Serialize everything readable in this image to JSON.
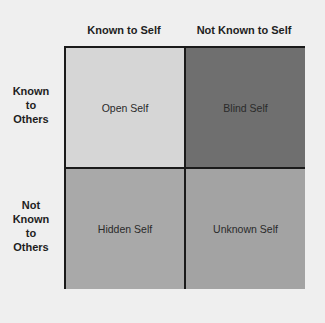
{
  "columns": [
    {
      "label": "Known to Self"
    },
    {
      "label": "Not Known to Self"
    }
  ],
  "rows": [
    {
      "label_lines": [
        "Known",
        "to",
        "Others"
      ]
    },
    {
      "label_lines": [
        "Not",
        "Known",
        "to",
        "Others"
      ]
    }
  ],
  "quadrants": [
    {
      "label": "Open Self",
      "color": "#d6d6d6"
    },
    {
      "label": "Blind Self",
      "color": "#6f6f6f"
    },
    {
      "label": "Hidden Self",
      "color": "#a9a9a9"
    },
    {
      "label": "Unknown Self",
      "color": "#a3a3a3"
    }
  ]
}
